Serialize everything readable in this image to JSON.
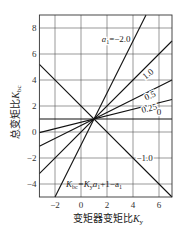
{
  "chart_data": {
    "type": "line",
    "title": "",
    "xlabel": "变矩器变矩比K_y",
    "ylabel": "总变矩比K_bc",
    "xlabel_parts": {
      "text": "变矩器变矩比",
      "var": "K",
      "sub": "y"
    },
    "ylabel_parts": {
      "text": "总变矩比",
      "var": "K",
      "sub": "bc"
    },
    "xlim": [
      -3.2,
      7
    ],
    "ylim": [
      -5,
      9
    ],
    "xticks": [
      -2,
      0,
      2,
      4,
      6
    ],
    "yticks": [
      -4,
      -2,
      0,
      2,
      4,
      6,
      8
    ],
    "xtick_labels": [
      "−2",
      "0",
      "2",
      "4",
      "6"
    ],
    "ytick_labels": [
      "−4",
      "−2",
      "0",
      "2",
      "4",
      "6",
      "8"
    ],
    "grid": true,
    "formula": "K_bc = K_y·a_1 + 1 − a_1",
    "formula_parts": [
      "K",
      "bc",
      "=K",
      "y",
      "a",
      "1",
      "+1−a",
      "1"
    ],
    "pivot_point": [
      1,
      1
    ],
    "series": [
      {
        "name": "a1=−2.0",
        "label": "a₁=−2.0",
        "slope": 2.0,
        "points": [
          [
            -2,
            -5
          ],
          [
            5,
            9
          ]
        ]
      },
      {
        "name": "1.0",
        "label": "1.0",
        "slope": 1.0,
        "points": [
          [
            -3.2,
            -3.2
          ],
          [
            7,
            7
          ]
        ]
      },
      {
        "name": "0.5",
        "label": "0.5",
        "slope": 0.5,
        "points": [
          [
            -3.2,
            -1.1
          ],
          [
            7,
            4
          ]
        ]
      },
      {
        "name": "0.25",
        "label": "0.25",
        "slope": 0.25,
        "points": [
          [
            -3.2,
            -0.05
          ],
          [
            7,
            2.5
          ]
        ]
      },
      {
        "name": "0",
        "label": "0",
        "slope": 0,
        "points": [
          [
            -3.2,
            1
          ],
          [
            7,
            1
          ]
        ]
      },
      {
        "name": "−1.0",
        "label": "−1.0",
        "slope": -1.0,
        "points": [
          [
            -3.2,
            5.2
          ],
          [
            7,
            -5
          ]
        ]
      }
    ],
    "annotations": [
      {
        "text_var": "a",
        "text_sub": "1",
        "text_rest": "=−2.0",
        "x": 2.7,
        "y": 6.9
      },
      {
        "text": "1.0",
        "x": 5.3,
        "y": 4.3,
        "rotate": -40
      },
      {
        "text": "0.5",
        "x": 5.4,
        "y": 2.6,
        "rotate": -24
      },
      {
        "text": "0.25",
        "x": 5.3,
        "y": 1.6,
        "rotate": -14
      },
      {
        "text": "0",
        "x": 6.0,
        "y": 1.3
      },
      {
        "text": "−1.0",
        "x": 4.9,
        "y": -2.2
      }
    ],
    "legend": "none (inline labels)"
  }
}
